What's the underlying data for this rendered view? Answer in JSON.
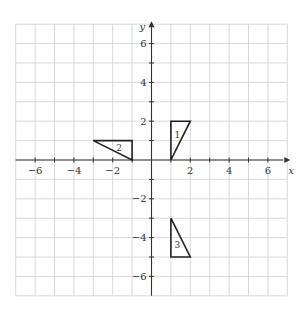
{
  "diagram": {
    "type": "coordinate-grid",
    "x_range": [
      -7,
      7
    ],
    "y_range": [
      -7,
      7
    ],
    "axes": {
      "x_label": "x",
      "y_label": "y"
    },
    "x_tick_labels": [
      {
        "value": -6,
        "label": "−6"
      },
      {
        "value": -4,
        "label": "−4"
      },
      {
        "value": -2,
        "label": "−2"
      },
      {
        "value": 2,
        "label": "2"
      },
      {
        "value": 4,
        "label": "4"
      },
      {
        "value": 6,
        "label": "6"
      }
    ],
    "y_tick_labels": [
      {
        "value": 6,
        "label": "6"
      },
      {
        "value": 4,
        "label": "4"
      },
      {
        "value": 2,
        "label": "2"
      },
      {
        "value": -2,
        "label": "−2"
      },
      {
        "value": -4,
        "label": "−4"
      },
      {
        "value": -6,
        "label": "−6"
      }
    ],
    "shapes": [
      {
        "label": "1",
        "vertices": [
          [
            1,
            0
          ],
          [
            1,
            2
          ],
          [
            2,
            2
          ]
        ]
      },
      {
        "label": "2",
        "vertices": [
          [
            -3,
            1
          ],
          [
            -1,
            1
          ],
          [
            -1,
            0
          ]
        ]
      },
      {
        "label": "3",
        "vertices": [
          [
            1,
            -3
          ],
          [
            1,
            -5
          ],
          [
            2,
            -5
          ]
        ]
      }
    ],
    "colors": {
      "grid": "#cfcfcf",
      "axis": "#333333",
      "shape": "#222222"
    }
  }
}
